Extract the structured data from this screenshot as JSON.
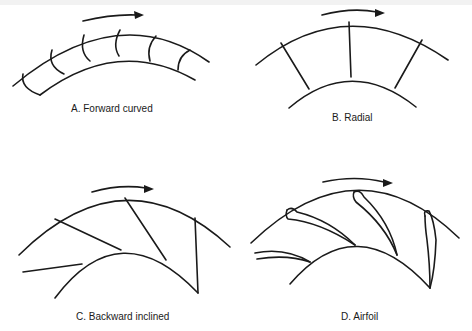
{
  "figure": {
    "panels": [
      {
        "id": "A",
        "label": "A. Forward curved",
        "blade_type": "forward-curved",
        "rotation": "clockwise"
      },
      {
        "id": "B",
        "label": "B. Radial",
        "blade_type": "radial",
        "rotation": "clockwise"
      },
      {
        "id": "C",
        "label": "C. Backward inclined",
        "blade_type": "backward-inclined",
        "rotation": "clockwise"
      },
      {
        "id": "D",
        "label": "D. Airfoil",
        "blade_type": "airfoil",
        "rotation": "clockwise"
      }
    ],
    "colors": {
      "line": "#1a1a1a",
      "background": "#ffffff"
    }
  }
}
